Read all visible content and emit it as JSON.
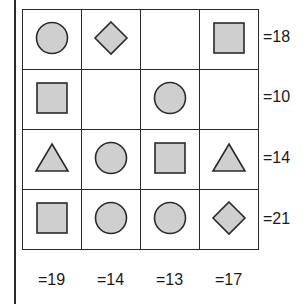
{
  "puzzle": {
    "grid": [
      [
        "circle",
        "diamond",
        "empty",
        "square"
      ],
      [
        "square",
        "empty",
        "circle",
        "empty"
      ],
      [
        "triangle",
        "circle",
        "square",
        "triangle"
      ],
      [
        "square",
        "circle",
        "circle",
        "diamond"
      ]
    ],
    "row_sums": [
      "=18",
      "=10",
      "=14",
      "=21"
    ],
    "col_sums": [
      "=19",
      "=14",
      "=13",
      "=17"
    ],
    "colors": {
      "shape_fill": "#cfcfcf",
      "shape_stroke": "#2a2a2a",
      "grid_line": "#2a2a2a",
      "background": "#ffffff"
    }
  }
}
